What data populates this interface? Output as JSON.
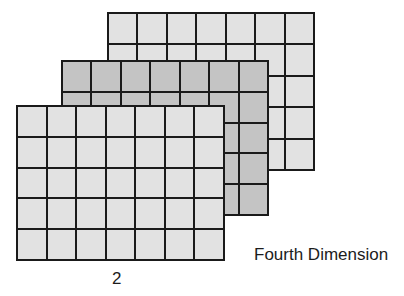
{
  "diagram": {
    "title": "Fourth Dimension",
    "index_label": "2",
    "grid": {
      "columns": 7,
      "rows": 5
    },
    "layers": [
      {
        "name": "back-layer",
        "fill": "#e2e2e2",
        "x": 107,
        "y": 12,
        "w": 208,
        "h": 159
      },
      {
        "name": "middle-layer",
        "fill": "#c4c4c4",
        "x": 61,
        "y": 60,
        "w": 208,
        "h": 156
      },
      {
        "name": "front-layer",
        "fill": "#e2e2e2",
        "x": 16,
        "y": 105,
        "w": 209,
        "h": 156
      }
    ],
    "colors": {
      "line": "#1a1a1a",
      "light_fill": "#e2e2e2",
      "dark_fill": "#c4c4c4",
      "text": "#1c1c1c"
    }
  }
}
